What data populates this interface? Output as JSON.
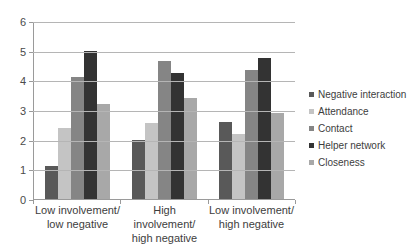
{
  "chart_data": {
    "type": "bar",
    "title": "",
    "subtitle": "",
    "xlabel": "",
    "ylabel": "",
    "ylim": [
      0,
      6
    ],
    "ytick_labels": [
      "0",
      "1",
      "2",
      "3",
      "4",
      "5",
      "6"
    ],
    "yticks": [
      0,
      1,
      2,
      3,
      4,
      5,
      6
    ],
    "grid": "horizontal",
    "legend_position": "right",
    "categories": [
      "Low involvement/ low negative",
      "High involvement/ high negative",
      "Low involvement/ high negative"
    ],
    "category_lines": [
      [
        "Low involvement/",
        "low negative"
      ],
      [
        "High involvement/",
        "high negative"
      ],
      [
        "Low involvement/",
        "high negative"
      ]
    ],
    "series": [
      {
        "name": "Negative interaction",
        "color": "#595959",
        "values": [
          1.1,
          2.0,
          2.6
        ]
      },
      {
        "name": "Attendance",
        "color": "#c4c4c4",
        "values": [
          2.4,
          2.55,
          2.2
        ]
      },
      {
        "name": "Contact",
        "color": "#858585",
        "values": [
          4.1,
          4.65,
          4.35
        ]
      },
      {
        "name": "Helper network",
        "color": "#333333",
        "values": [
          5.0,
          4.25,
          4.75
        ]
      },
      {
        "name": "Closeness",
        "color": "#a8a8a8",
        "values": [
          3.2,
          3.4,
          2.9
        ]
      }
    ]
  },
  "colors": {
    "background": "#ffffff",
    "gridline": "#b5b5b5",
    "axis": "#9a9a9a",
    "text": "#3d3d3d"
  }
}
